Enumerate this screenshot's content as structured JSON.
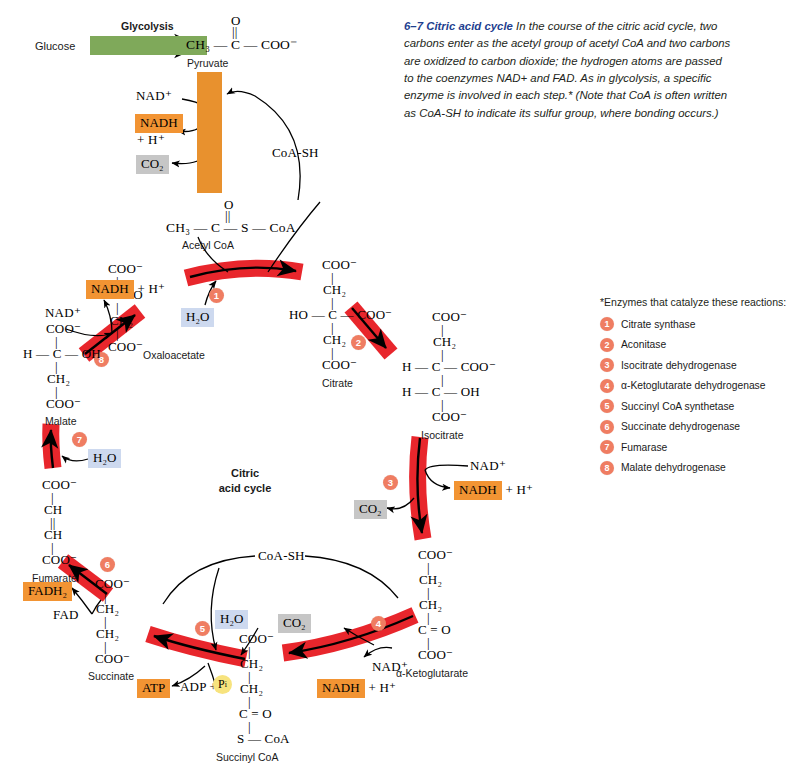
{
  "figure": {
    "number": "6–7",
    "title": "Citric acid cycle",
    "caption": "In the course of the citric acid cycle, two carbons enter as the acetyl group of acetyl CoA and two carbons are oxidized to carbon dioxide; the hydrogen atoms are passed to the coenzymes NAD+ and FAD. As in glycolysis, a specific enzyme is involved in each step.* (Note that CoA is often written as CoA-SH to indicate its sulfur group, where bonding occurs.)"
  },
  "center_label": {
    "line1": "Citric",
    "line2": "acid cycle"
  },
  "glycolysis": {
    "label": "Glycolysis",
    "substrate": "Glucose"
  },
  "legend": {
    "title": "*Enzymes that catalyze these reactions:",
    "items": [
      {
        "n": "1",
        "name": "Citrate synthase"
      },
      {
        "n": "2",
        "name": "Aconitase"
      },
      {
        "n": "3",
        "name": "Isocitrate dehydrogenase"
      },
      {
        "n": "4",
        "name": "α-Ketoglutarate dehydrogenase"
      },
      {
        "n": "5",
        "name": "Succinyl CoA synthetase"
      },
      {
        "n": "6",
        "name": "Succinate dehydrogenase"
      },
      {
        "n": "7",
        "name": "Fumarase"
      },
      {
        "n": "8",
        "name": "Malate dehydrogenase"
      }
    ]
  },
  "molecules": {
    "pyruvate": {
      "label": "Pyruvate",
      "f_top": "O",
      "f_bond": "||",
      "f_main": "CH₃ — C — COO⁻"
    },
    "acetyl_coa": {
      "label": "Acetyl CoA",
      "f_top": "O",
      "f_bond": "||",
      "f_main": "CH₃ — C — S — CoA"
    },
    "citrate": {
      "label": "Citrate",
      "rows": [
        "COO⁻",
        "CH₂",
        "HO — C — COO⁻",
        "CH₂",
        "COO⁻"
      ]
    },
    "isocitrate": {
      "label": "Isocitrate",
      "rows": [
        "COO⁻",
        "CH₂",
        "H — C — COO⁻",
        "H — C — OH",
        "COO⁻"
      ]
    },
    "alpha_ketoglutarate": {
      "label": "α-Ketoglutarate",
      "rows": [
        "COO⁻",
        "CH₂",
        "CH₂",
        "C = O",
        "COO⁻"
      ]
    },
    "succinyl_coa": {
      "label": "Succinyl CoA",
      "rows": [
        "COO⁻",
        "CH₂",
        "CH₂",
        "C = O",
        "S — CoA"
      ]
    },
    "succinate": {
      "label": "Succinate",
      "rows": [
        "COO⁻",
        "CH₂",
        "CH₂",
        "COO⁻"
      ]
    },
    "fumarate": {
      "label": "Fumarate",
      "rows": [
        "COO⁻",
        "CH",
        "CH",
        "COO⁻"
      ]
    },
    "malate": {
      "label": "Malate",
      "rows": [
        "COO⁻",
        "H — C — OH",
        "CH₂",
        "COO⁻"
      ]
    },
    "oxaloacetate": {
      "label": "Oxaloacetate",
      "rows": [
        "COO⁻",
        "C = O",
        "CH₂",
        "COO⁻"
      ]
    }
  },
  "cofactors": {
    "nad_plus": "NAD⁺",
    "nadh": "NADH",
    "plus_h": "+ H⁺",
    "nadh_h_inline": "+ H⁺",
    "co2": "CO₂",
    "coash": "CoA-SH",
    "water": "H₂O",
    "fad": "FAD",
    "fadh2": "FADH₂",
    "atp": "ATP",
    "adp": "ADP +",
    "pi": "P",
    "pi_sub": "i"
  },
  "colors": {
    "arrow_red": "#e8262c",
    "badge": "#ef7d62",
    "orange_chip": "#f29433",
    "grey_chip": "#c6c6c6",
    "blue_chip": "#cdd9ef",
    "green_arrow": "#7fa95a",
    "pyruvate_band": "#e8912e",
    "caption_blue": "#1f3f8f",
    "pi_yellow": "#f7e37e"
  }
}
